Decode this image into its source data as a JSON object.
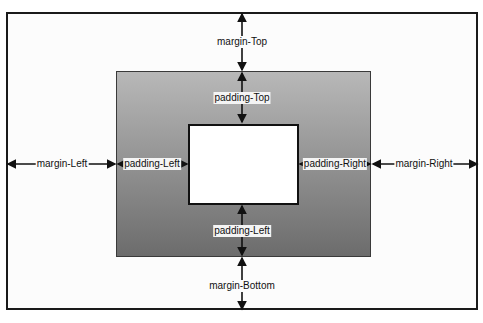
{
  "diagram": {
    "type": "css-box-model",
    "colors": {
      "outer_border": "#1a1a1a",
      "padding_top": "#b8b8b8",
      "padding_bottom": "#6c6c6c",
      "content_fill": "#ffffff",
      "arrow": "#111111"
    },
    "labels": {
      "margin_top": "margin-Top",
      "margin_bottom": "margin-Bottom",
      "margin_left": "margin-Left",
      "margin_right": "margin-Right",
      "padding_top": "padding-Top",
      "padding_bottom": "padding-Left",
      "padding_left": "padding-Left",
      "padding_right": "padding-Right"
    }
  }
}
